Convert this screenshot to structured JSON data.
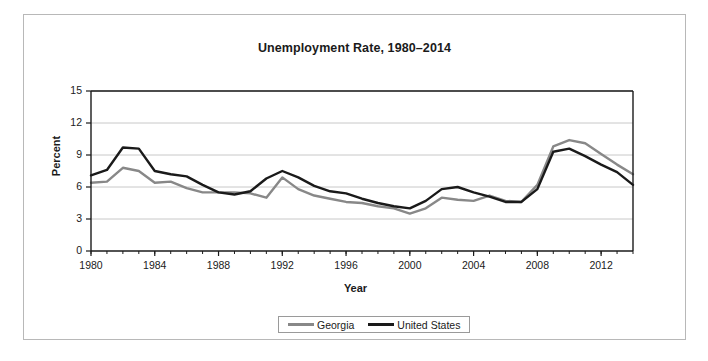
{
  "figure": {
    "title": "Unemployment Rate, 1980–2014"
  },
  "axes": {
    "y_title": "Percent",
    "x_title": "Year",
    "y_ticks": [
      "0",
      "3",
      "6",
      "9",
      "12",
      "15"
    ],
    "x_ticks": [
      "1980",
      "1984",
      "1988",
      "1992",
      "1996",
      "2000",
      "2004",
      "2008",
      "2012"
    ]
  },
  "legend": {
    "items": [
      {
        "label": "Georgia",
        "color": "#888888"
      },
      {
        "label": "United States",
        "color": "#1a1a1a"
      }
    ]
  },
  "colors": {
    "georgia": "#888888",
    "united_states": "#1a1a1a",
    "gridline": "#c8c8c8",
    "axis": "#1a1a1a",
    "frame": "#b8b8b8"
  },
  "chart_data": {
    "type": "line",
    "title": "Unemployment Rate, 1980–2014",
    "xlabel": "Year",
    "ylabel": "Percent",
    "xlim": [
      1980,
      2014
    ],
    "ylim": [
      0,
      15
    ],
    "ytick_step": 3,
    "xtick_step": 4,
    "minor_xtick_step": 1,
    "grid": "horizontal",
    "legend_position": "bottom-center",
    "x": [
      1980,
      1981,
      1982,
      1983,
      1984,
      1985,
      1986,
      1987,
      1988,
      1989,
      1990,
      1991,
      1992,
      1993,
      1994,
      1995,
      1996,
      1997,
      1998,
      1999,
      2000,
      2001,
      2002,
      2003,
      2004,
      2005,
      2006,
      2007,
      2008,
      2009,
      2010,
      2011,
      2012,
      2013,
      2014
    ],
    "series": [
      {
        "name": "Georgia",
        "color": "#888888",
        "values": [
          6.4,
          6.5,
          7.8,
          7.5,
          6.4,
          6.5,
          5.9,
          5.5,
          5.5,
          5.5,
          5.4,
          5.0,
          6.9,
          5.8,
          5.2,
          4.9,
          4.6,
          4.5,
          4.2,
          4.0,
          3.5,
          4.0,
          5.0,
          4.8,
          4.7,
          5.2,
          4.7,
          4.6,
          6.2,
          9.8,
          10.4,
          10.1,
          9.1,
          8.1,
          7.2
        ]
      },
      {
        "name": "United States",
        "color": "#1a1a1a",
        "values": [
          7.1,
          7.6,
          9.7,
          9.6,
          7.5,
          7.2,
          7.0,
          6.2,
          5.5,
          5.3,
          5.6,
          6.8,
          7.5,
          6.9,
          6.1,
          5.6,
          5.4,
          4.9,
          4.5,
          4.2,
          4.0,
          4.7,
          5.8,
          6.0,
          5.5,
          5.1,
          4.6,
          4.6,
          5.8,
          9.3,
          9.6,
          8.9,
          8.1,
          7.4,
          6.2
        ]
      }
    ]
  }
}
